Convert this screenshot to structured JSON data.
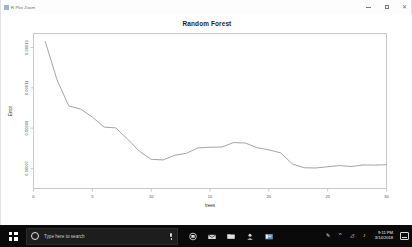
{
  "window": {
    "title": "R Plot Zoom",
    "icon": "plot-window-icon",
    "controls": {
      "minimize": "minimize-icon",
      "maximize": "maximize-icon",
      "close": "close-icon"
    }
  },
  "chart_data": {
    "type": "line",
    "title": "Random Forest",
    "xlabel": "trees",
    "ylabel": "Error",
    "xlim": [
      0,
      30
    ],
    "ylim": [
      6e-05,
      0.000137
    ],
    "xticks": [
      0,
      5,
      10,
      15,
      20,
      25,
      30
    ],
    "xticklabels": [
      "0",
      "5",
      "10",
      "15",
      "20",
      "25",
      "30"
    ],
    "yticks": [
      7e-05,
      9e-05,
      0.00011,
      0.00013
    ],
    "yticklabels": [
      "0.00007",
      "0.00009",
      "0.00011",
      "0.00013"
    ],
    "grid": false,
    "legend": false,
    "line_color": "#9a9a9a",
    "x": [
      1,
      2,
      3,
      4,
      5,
      6,
      7,
      8,
      9,
      10,
      11,
      12,
      13,
      14,
      15,
      16,
      17,
      18,
      19,
      20,
      21,
      22,
      23,
      24,
      25,
      26,
      27,
      28,
      29,
      30
    ],
    "y": [
      0.000133,
      0.000114,
      0.000101,
      9.95e-05,
      9.55e-05,
      9.05e-05,
      9.01e-05,
      8.45e-05,
      7.85e-05,
      7.45e-05,
      7.42e-05,
      7.65e-05,
      7.75e-05,
      8.02e-05,
      8.05e-05,
      8.06e-05,
      8.28e-05,
      8.26e-05,
      8.03e-05,
      7.92e-05,
      7.77e-05,
      7.22e-05,
      7.03e-05,
      7.02e-05,
      7.08e-05,
      7.14e-05,
      7.09e-05,
      7.17e-05,
      7.16e-05,
      7.18e-05
    ]
  },
  "taskbar": {
    "start": "windows-logo",
    "search": {
      "placeholder": "Type here to search",
      "cortana_icon": "cortana-circle-icon",
      "mic_icon": "microphone-icon"
    },
    "pinned": [
      {
        "name": "task-view-icon"
      },
      {
        "name": "mail-icon"
      },
      {
        "name": "file-explorer-icon"
      },
      {
        "name": "people-icon"
      },
      {
        "name": "rstudio-icon"
      }
    ],
    "tray": {
      "pen_icon": "pen-icon",
      "chevron_icon": "show-hidden-icons-chevron",
      "network_icon": "network-icon",
      "volume_icon": "volume-icon",
      "time": "9:11 PM",
      "date": "3/14/2018",
      "action_center": "action-center-icon"
    }
  }
}
